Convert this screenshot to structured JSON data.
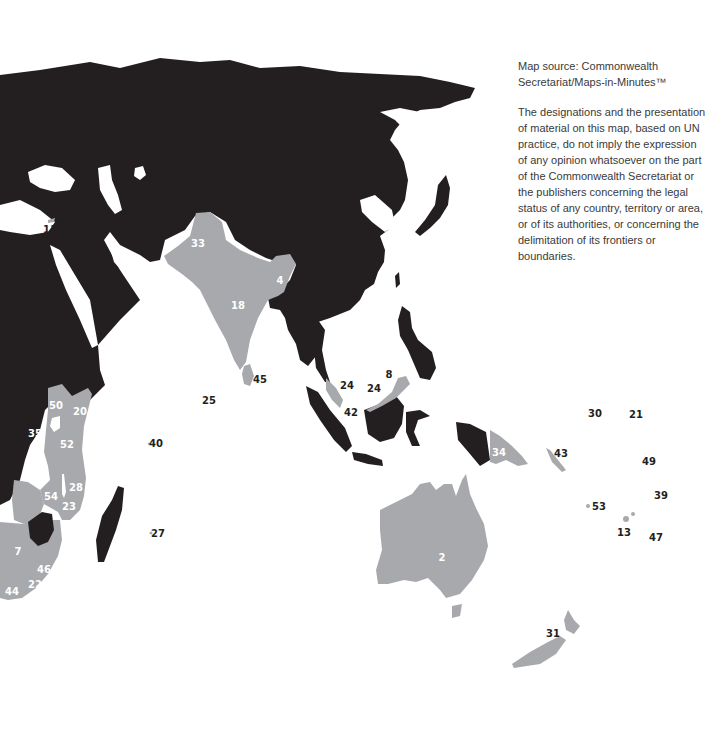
{
  "map": {
    "colors": {
      "commonwealth": "#a7a9ac",
      "non_commonwealth": "#231f20",
      "sea": "#ffffff"
    },
    "labels": [
      {
        "id": "11",
        "x": 50,
        "y": 230,
        "bg": "sea"
      },
      {
        "id": "33",
        "x": 198,
        "y": 244,
        "bg": "grey"
      },
      {
        "id": "4",
        "x": 280,
        "y": 281,
        "bg": "grey"
      },
      {
        "id": "18",
        "x": 238,
        "y": 306,
        "bg": "grey"
      },
      {
        "id": "45",
        "x": 260,
        "y": 380,
        "bg": "sea"
      },
      {
        "id": "24",
        "x": 347,
        "y": 386,
        "bg": "sea"
      },
      {
        "id": "8",
        "x": 389,
        "y": 375,
        "bg": "sea"
      },
      {
        "id": "24",
        "x": 374,
        "y": 389,
        "bg": "sea"
      },
      {
        "id": "42",
        "x": 351,
        "y": 413,
        "bg": "sea"
      },
      {
        "id": "25",
        "x": 209,
        "y": 401,
        "bg": "sea"
      },
      {
        "id": "50",
        "x": 56,
        "y": 406,
        "bg": "grey"
      },
      {
        "id": "20",
        "x": 80,
        "y": 412,
        "bg": "grey"
      },
      {
        "id": "35",
        "x": 35,
        "y": 434,
        "bg": "dark"
      },
      {
        "id": "52",
        "x": 67,
        "y": 445,
        "bg": "grey"
      },
      {
        "id": "40",
        "x": 156,
        "y": 444,
        "bg": "sea"
      },
      {
        "id": "28",
        "x": 76,
        "y": 488,
        "bg": "grey"
      },
      {
        "id": "54",
        "x": 51,
        "y": 497,
        "bg": "grey"
      },
      {
        "id": "23",
        "x": 69,
        "y": 507,
        "bg": "grey"
      },
      {
        "id": "27",
        "x": 158,
        "y": 534,
        "bg": "sea"
      },
      {
        "id": "7",
        "x": 18,
        "y": 552,
        "bg": "grey"
      },
      {
        "id": "46",
        "x": 44,
        "y": 570,
        "bg": "grey"
      },
      {
        "id": "22",
        "x": 35,
        "y": 585,
        "bg": "grey"
      },
      {
        "id": "44",
        "x": 12,
        "y": 592,
        "bg": "grey"
      },
      {
        "id": "34",
        "x": 499,
        "y": 453,
        "bg": "grey"
      },
      {
        "id": "43",
        "x": 561,
        "y": 454,
        "bg": "sea"
      },
      {
        "id": "30",
        "x": 595,
        "y": 414,
        "bg": "sea"
      },
      {
        "id": "21",
        "x": 636,
        "y": 415,
        "bg": "sea"
      },
      {
        "id": "49",
        "x": 649,
        "y": 462,
        "bg": "sea"
      },
      {
        "id": "39",
        "x": 661,
        "y": 496,
        "bg": "sea"
      },
      {
        "id": "53",
        "x": 599,
        "y": 507,
        "bg": "sea"
      },
      {
        "id": "13",
        "x": 624,
        "y": 533,
        "bg": "sea"
      },
      {
        "id": "47",
        "x": 656,
        "y": 538,
        "bg": "sea"
      },
      {
        "id": "2",
        "x": 442,
        "y": 558,
        "bg": "grey"
      },
      {
        "id": "31",
        "x": 553,
        "y": 634,
        "bg": "sea"
      }
    ]
  },
  "note": {
    "source": "Map source: Commonwealth Secretariat/Maps-in-Minutes™",
    "disclaimer": "The designations and the presentation of material on this map, based on UN practice, do not imply the expression of any opinion whatsoever on the part of the Commonwealth Secretariat or the publishers concerning the legal status of any country, territory or area, or of its authorities, or concerning the delimitation of its frontiers or boundaries."
  }
}
